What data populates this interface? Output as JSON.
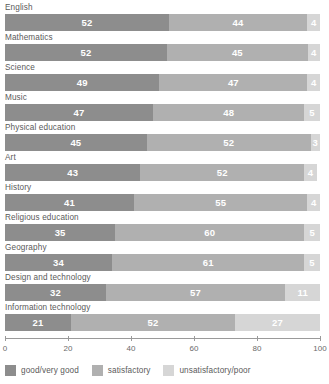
{
  "chart_data": {
    "type": "bar",
    "orientation": "horizontal",
    "stacked": true,
    "title": "",
    "xlabel": "",
    "ylabel": "",
    "xlim": [
      0,
      100
    ],
    "xticks": [
      0,
      20,
      40,
      60,
      80,
      100
    ],
    "grid": false,
    "legend_position": "bottom",
    "categories": [
      "English",
      "Mathematics",
      "Science",
      "Music",
      "Physical education",
      "Art",
      "History",
      "Religious education",
      "Geography",
      "Design and technology",
      "Information technology"
    ],
    "series": [
      {
        "name": "good/very good",
        "color": "#8d8d8d",
        "values": [
          52,
          52,
          49,
          47,
          45,
          43,
          41,
          35,
          34,
          32,
          21
        ]
      },
      {
        "name": "satisfactory",
        "color": "#b0b0b0",
        "values": [
          44,
          45,
          47,
          48,
          52,
          52,
          55,
          60,
          61,
          57,
          52
        ]
      },
      {
        "name": "unsatisfactory/poor",
        "color": "#d6d6d6",
        "values": [
          4,
          4,
          4,
          5,
          3,
          4,
          4,
          5,
          5,
          11,
          27
        ]
      }
    ]
  },
  "axis": {
    "tick_labels": [
      "0",
      "20",
      "40",
      "60",
      "80",
      "100"
    ]
  },
  "legend": {
    "items": [
      {
        "label": "good/very good",
        "color": "#8d8d8d"
      },
      {
        "label": "satisfactory",
        "color": "#b0b0b0"
      },
      {
        "label": "unsatisfactory/poor",
        "color": "#d6d6d6"
      }
    ]
  }
}
